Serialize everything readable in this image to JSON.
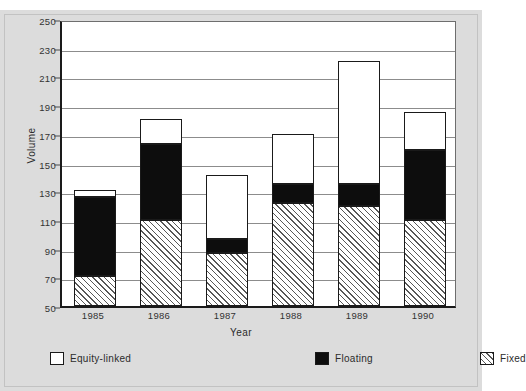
{
  "figure": {
    "caption_ghost": "",
    "background_color": "#dcdcdc",
    "plot_background_color": "#ffffff",
    "axis_color": "#1a1a1a",
    "grid_color": "#8c8c8c"
  },
  "chart_data": {
    "type": "bar",
    "stacked": true,
    "title": "",
    "xlabel": "Year",
    "ylabel": "Volume",
    "categories": [
      "1985",
      "1986",
      "1987",
      "1988",
      "1989",
      "1990"
    ],
    "ylim": [
      50,
      250
    ],
    "yticks": [
      50,
      70,
      90,
      110,
      130,
      150,
      170,
      190,
      210,
      230,
      250
    ],
    "grid": true,
    "grid_axis": "y",
    "legend_position": "bottom",
    "series": [
      {
        "name": "Fixed",
        "fill": "hatched-diagonal",
        "color": "#ffffff",
        "hatch_color": "#575757",
        "values": [
          21,
          60,
          37,
          72,
          70,
          60
        ],
        "cumulative_tops": [
          71,
          110,
          87,
          122,
          120,
          110
        ]
      },
      {
        "name": "Floating",
        "fill": "solid",
        "color": "#0d0d0d",
        "values": [
          55,
          53,
          10,
          13,
          15,
          49
        ],
        "cumulative_tops": [
          126,
          163,
          97,
          135,
          135,
          159
        ]
      },
      {
        "name": "Equity-linked",
        "fill": "solid",
        "color": "#ffffff",
        "values": [
          5,
          17,
          44,
          35,
          86,
          26
        ],
        "cumulative_tops": [
          131,
          180,
          141,
          170,
          221,
          185
        ]
      }
    ],
    "totals": [
      131,
      180,
      141,
      170,
      221,
      185
    ]
  },
  "legend": {
    "items": [
      {
        "label": "Equity-linked",
        "swatch": "equity"
      },
      {
        "label": "Floating",
        "swatch": "floating"
      },
      {
        "label": "Fixed",
        "swatch": "fixed"
      }
    ]
  }
}
